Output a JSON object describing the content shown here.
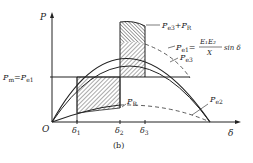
{
  "diagram": {
    "axes": {
      "y_label": "P",
      "x_label": "δ",
      "origin": "O"
    },
    "pm_label_main": "P",
    "pm_label_sub": "m",
    "pm_eq": "=P",
    "pm_eq_sub": "e1",
    "curves": {
      "pe3_plus_pr": {
        "main": "P",
        "sub": "e3",
        "plus": "+P",
        "sub2": "R"
      },
      "pe1": {
        "main": "P",
        "sub": "e1",
        "eq": "=",
        "num": "E₁E₂",
        "den": "X",
        "tail": "sin δ"
      },
      "pe3": {
        "main": "P",
        "sub": "e3"
      },
      "pr": {
        "main": "P",
        "sub": "R"
      },
      "pe2": {
        "main": "P",
        "sub": "e2"
      }
    },
    "x_ticks": [
      {
        "main": "δ",
        "sub": "1"
      },
      {
        "main": "δ",
        "sub": "2"
      },
      {
        "main": "δ",
        "sub": "3"
      }
    ],
    "caption": "(b)"
  }
}
